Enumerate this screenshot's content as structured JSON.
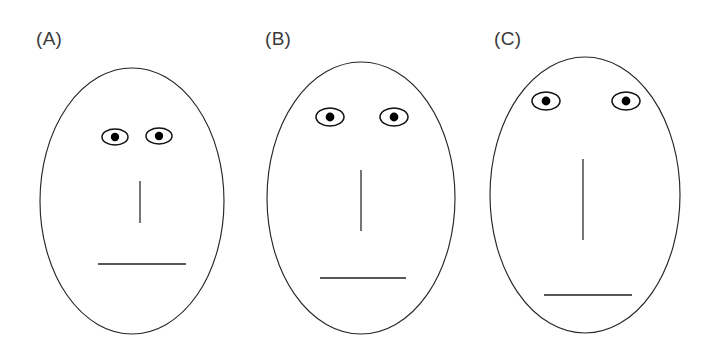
{
  "figure": {
    "background_color": "#ffffff",
    "line_color": "#262626",
    "width": 709,
    "height": 352
  },
  "panels": [
    {
      "label": "(A)",
      "label_x": 36,
      "label_y": 45,
      "face": {
        "cx": 132,
        "cy": 201,
        "rx": 92,
        "ry": 133
      },
      "eyes": [
        {
          "cx": 115,
          "cy": 137,
          "rx": 13,
          "ry": 8,
          "pupil_r": 4.2
        },
        {
          "cx": 159,
          "cy": 136,
          "rx": 13,
          "ry": 8,
          "pupil_r": 4.2
        }
      ],
      "nose": {
        "x": 140,
        "y1": 181,
        "y2": 223
      },
      "mouth": {
        "x1": 98,
        "x2": 186,
        "y": 264
      },
      "feature_notes": {
        "eye_separation": 44,
        "eye_height_from_top": 68,
        "nose_length": 42,
        "mouth_offset_from_nose": 41
      }
    },
    {
      "label": "(B)",
      "label_x": 265,
      "label_y": 45,
      "face": {
        "cx": 361,
        "cy": 198,
        "rx": 94,
        "ry": 136
      },
      "eyes": [
        {
          "cx": 330,
          "cy": 117,
          "rx": 14,
          "ry": 9,
          "pupil_r": 4.4
        },
        {
          "cx": 394,
          "cy": 117,
          "rx": 14,
          "ry": 9,
          "pupil_r": 4.4
        }
      ],
      "nose": {
        "x": 361,
        "y1": 170,
        "y2": 231
      },
      "mouth": {
        "x1": 320,
        "x2": 406,
        "y": 278
      },
      "feature_notes": {
        "eye_separation": 64,
        "eye_height_from_top": 55,
        "nose_length": 61,
        "mouth_offset_from_nose": 47
      }
    },
    {
      "label": "(C)",
      "label_x": 494,
      "label_y": 45,
      "face": {
        "cx": 585,
        "cy": 195,
        "rx": 95,
        "ry": 138
      },
      "eyes": [
        {
          "cx": 546,
          "cy": 101,
          "rx": 14,
          "ry": 9,
          "pupil_r": 4.4
        },
        {
          "cx": 626,
          "cy": 101,
          "rx": 14,
          "ry": 9,
          "pupil_r": 4.4
        }
      ],
      "nose": {
        "x": 583,
        "y1": 159,
        "y2": 240
      },
      "mouth": {
        "x1": 544,
        "x2": 632,
        "y": 295
      },
      "feature_notes": {
        "eye_separation": 80,
        "eye_height_from_top": 44,
        "nose_length": 81,
        "mouth_offset_from_nose": 55
      }
    }
  ]
}
